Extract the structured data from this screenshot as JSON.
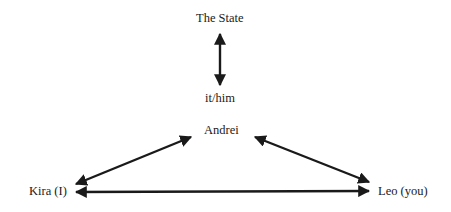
{
  "nodes": {
    "state": {
      "label": "The State"
    },
    "it": {
      "label": "it/him"
    },
    "andrei": {
      "label": "Andrei"
    },
    "kira": {
      "label": "Kira (I)"
    },
    "leo": {
      "label": "Leo (you)"
    }
  },
  "edges": [
    {
      "from": "The State",
      "to": "it/him",
      "type": "bidirectional"
    },
    {
      "from": "Andrei",
      "to": "Kira (I)",
      "type": "bidirectional"
    },
    {
      "from": "Andrei",
      "to": "Leo (you)",
      "type": "bidirectional"
    },
    {
      "from": "Kira (I)",
      "to": "Leo (you)",
      "type": "bidirectional"
    }
  ],
  "colors": {
    "ink": "#1a1a1a",
    "background": "#ffffff"
  }
}
